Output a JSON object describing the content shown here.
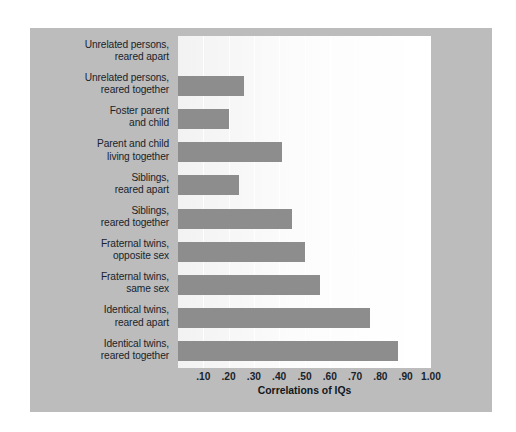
{
  "figure": {
    "panel_color": "#bcbcbc",
    "plot_background": "#fbfbfb",
    "bar_color": "#8d8d8d",
    "text_color": "#19232b"
  },
  "chart_data": {
    "type": "bar",
    "orientation": "horizontal",
    "title": "",
    "xlabel": "Correlations of IQs",
    "ylabel": "",
    "xlim": [
      0,
      1.0
    ],
    "grid": true,
    "legend": "none",
    "xticks": [
      {
        "value": 0.1,
        "label": ".10"
      },
      {
        "value": 0.2,
        "label": ".20"
      },
      {
        "value": 0.3,
        "label": ".30"
      },
      {
        "value": 0.4,
        "label": ".40"
      },
      {
        "value": 0.5,
        "label": ".50"
      },
      {
        "value": 0.6,
        "label": ".60"
      },
      {
        "value": 0.7,
        "label": ".70"
      },
      {
        "value": 0.8,
        "label": ".80"
      },
      {
        "value": 0.9,
        "label": ".90"
      },
      {
        "value": 1.0,
        "label": "1.00"
      }
    ],
    "categories": [
      "Unrelated persons, reared apart",
      "Unrelated persons, reared together",
      "Foster parent and child",
      "Parent and child living together",
      "Siblings, reared apart",
      "Siblings, reared together",
      "Fraternal twins, opposite sex",
      "Fraternal twins, same sex",
      "Identical twins, reared apart",
      "Identical twins, reared together"
    ],
    "values": [
      0.0,
      0.26,
      0.2,
      0.41,
      0.24,
      0.45,
      0.5,
      0.56,
      0.76,
      0.87
    ],
    "rows": [
      {
        "line1": "Unrelated persons,",
        "line2": "reared apart",
        "value": 0.0
      },
      {
        "line1": "Unrelated persons,",
        "line2": "reared together",
        "value": 0.26
      },
      {
        "line1": "Foster parent",
        "line2": "and child",
        "value": 0.2
      },
      {
        "line1": "Parent and child",
        "line2": "living together",
        "value": 0.41
      },
      {
        "line1": "Siblings,",
        "line2": "reared apart",
        "value": 0.24
      },
      {
        "line1": "Siblings,",
        "line2": "reared together",
        "value": 0.45
      },
      {
        "line1": "Fraternal twins,",
        "line2": "opposite sex",
        "value": 0.5
      },
      {
        "line1": "Fraternal twins,",
        "line2": "same sex",
        "value": 0.56
      },
      {
        "line1": "Identical twins,",
        "line2": "reared apart",
        "value": 0.76
      },
      {
        "line1": "Identical twins,",
        "line2": "reared together",
        "value": 0.87
      }
    ]
  }
}
